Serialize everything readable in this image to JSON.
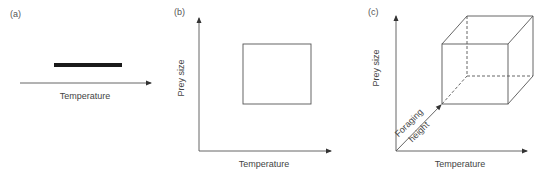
{
  "figure": {
    "colors": {
      "line": "#555555",
      "bar": "#1a1a1a",
      "text": "#444444"
    },
    "panels": [
      {
        "id": "a",
        "label": "(a)",
        "x_axis_label": "Temperature",
        "element": "temperature range bar"
      },
      {
        "id": "b",
        "label": "(b)",
        "x_axis_label": "Temperature",
        "y_axis_label": "Prey size",
        "element": "2D niche rectangle"
      },
      {
        "id": "c",
        "label": "(c)",
        "x_axis_label": "Temperature",
        "y_axis_label": "Prey size",
        "z_axis_label_line1": "Foraging",
        "z_axis_label_line2": "height",
        "element": "3D niche cube"
      }
    ]
  }
}
